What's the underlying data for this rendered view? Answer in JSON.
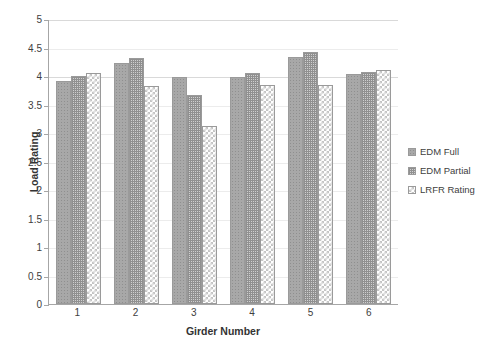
{
  "chart_data": {
    "type": "bar",
    "title": "",
    "xlabel": "Girder Number",
    "ylabel": "Load Rating",
    "categories": [
      "1",
      "2",
      "3",
      "4",
      "5",
      "6"
    ],
    "series": [
      {
        "name": "EDM Full",
        "values": [
          3.92,
          4.23,
          3.99,
          3.98,
          4.34,
          4.04
        ]
      },
      {
        "name": "EDM Partial",
        "values": [
          4.0,
          4.31,
          3.66,
          4.05,
          4.42,
          4.07
        ]
      },
      {
        "name": "LRFR Rating",
        "values": [
          4.06,
          3.82,
          3.12,
          3.84,
          3.85,
          4.1
        ]
      }
    ],
    "ylim": [
      0,
      5
    ],
    "ytick_step": 0.5,
    "yticks": [
      "0",
      "0.5",
      "1",
      "1.5",
      "2",
      "2.5",
      "3",
      "3.5",
      "4",
      "4.5",
      "5"
    ],
    "grid": true,
    "legend_position": "right",
    "colors": {
      "series_0": "#a8a8a8",
      "series_1": "#cfcfcf",
      "series_2": "#ffffff",
      "bar_border": "#9a9a9a",
      "gridline": "#d9d9d9",
      "axis": "#a6a6a6",
      "text": "#404040",
      "background": "#ffffff"
    }
  }
}
